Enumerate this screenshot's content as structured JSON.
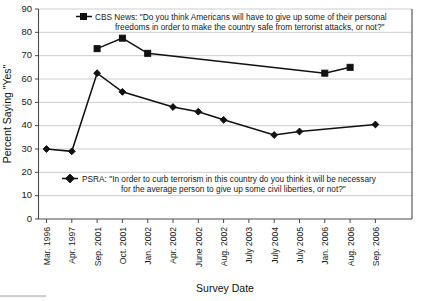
{
  "chart_data": {
    "type": "line",
    "title": "",
    "xlabel": "Survey Date",
    "ylabel": "Percent Saying \"Yes\"",
    "ylim": [
      0,
      90
    ],
    "ytick_step": 10,
    "grid": true,
    "legend_position": "inside-top-and-middle",
    "categories": [
      "Mar. 1996",
      "Apr. 1997",
      "Sep. 2001",
      "Oct. 2001",
      "Jan. 2002",
      "Apr. 2002",
      "June 2002",
      "Aug. 2002",
      "July 2003",
      "July 2004",
      "July 2005",
      "Jan. 2006",
      "Aug. 2006",
      "Sep. 2006"
    ],
    "yticks": [
      0,
      10,
      20,
      30,
      40,
      50,
      60,
      70,
      80,
      90
    ],
    "series": [
      {
        "name": "CBS News",
        "marker": "square",
        "color": "#111111",
        "legend_label": "CBS News: \"Do you think Americans will have to give up some of their personal freedoms in order to make the country safe from terrorist attacks, or not?\"",
        "legend_line1": "CBS News: \"Do you think Americans will have to give up some of their personal",
        "legend_line2": "freedoms in order to make the country safe from terrorist attacks, or not?\"",
        "points": [
          {
            "x": "Sep. 2001",
            "y": 73
          },
          {
            "x": "Oct. 2001",
            "y": 77.5
          },
          {
            "x": "Jan. 2002",
            "y": 71
          },
          {
            "x": "Jan. 2006",
            "y": 62.5
          },
          {
            "x": "Aug. 2006",
            "y": 65
          }
        ]
      },
      {
        "name": "PSRA",
        "marker": "diamond",
        "color": "#111111",
        "legend_label": "PSRA: \"In order to curb terrorism in this country do you think it will be necessary for the average person to give up some civil liberties, or not?\"",
        "legend_line1": "PSRA: \"In order to curb terrorism in this country do you think it will be necessary",
        "legend_line2": "for the average person to give up some civil liberties, or not?\"",
        "points": [
          {
            "x": "Mar. 1996",
            "y": 30
          },
          {
            "x": "Apr. 1997",
            "y": 29
          },
          {
            "x": "Sep. 2001",
            "y": 62.5
          },
          {
            "x": "Oct. 2001",
            "y": 54.5
          },
          {
            "x": "Apr. 2002",
            "y": 48
          },
          {
            "x": "June 2002",
            "y": 46
          },
          {
            "x": "Aug. 2002",
            "y": 42.5
          },
          {
            "x": "July 2004",
            "y": 36
          },
          {
            "x": "July 2005",
            "y": 37.5
          },
          {
            "x": "Sep. 2006",
            "y": 40.5
          }
        ]
      }
    ]
  },
  "caption": {
    "partial_text": ""
  }
}
